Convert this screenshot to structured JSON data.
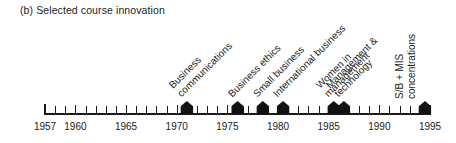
{
  "figure": {
    "panel_label": "(b)",
    "title": "(b) Selected course innovation"
  },
  "chart_data": {
    "type": "timeline",
    "title": "(b) Selected course innovation",
    "xlabel": "",
    "ylabel": "",
    "xlim": [
      1956,
      1996
    ],
    "axis_start": 1956,
    "axis_end": 1996,
    "grid": false,
    "legend": false,
    "tick_interval": 1,
    "tick_labels": [
      "1957",
      "1960",
      "1965",
      "1970",
      "1975",
      "1980",
      "1985",
      "1990",
      "1995"
    ],
    "tick_label_values": [
      1957,
      1960,
      1965,
      1970,
      1975,
      1980,
      1985,
      1990,
      1995
    ],
    "marker_shape": "pentagon",
    "marker_color": "#121212",
    "events": [
      {
        "year": 1971,
        "label": "Business communications",
        "label_lines": [
          "Business",
          "communications"
        ],
        "rotation": 45
      },
      {
        "year": 1976,
        "label": "Business ethics",
        "label_lines": [
          "Business ethics"
        ],
        "rotation": 45
      },
      {
        "year": 1978.5,
        "label": "Small business",
        "label_lines": [
          "Small business"
        ],
        "rotation": 45
      },
      {
        "year": 1980.5,
        "label": "International business",
        "label_lines": [
          "International business"
        ],
        "rotation": 45
      },
      {
        "year": 1985.5,
        "label": "Women in management",
        "label_lines": [
          "Women in",
          "management"
        ],
        "rotation": 45
      },
      {
        "year": 1986.5,
        "label": "Management & technology",
        "label_lines": [
          "Management &",
          "technology"
        ],
        "rotation": 45
      },
      {
        "year": 1994.5,
        "label": "S/B + MIS concentrations",
        "label_lines": [
          "S/B + MIS",
          "concentrations"
        ],
        "rotation": 90
      }
    ]
  },
  "axis": {
    "ticks": [
      {
        "value": 1957,
        "major": true,
        "label": "1957"
      },
      {
        "value": 1958,
        "major": false,
        "label": ""
      },
      {
        "value": 1959,
        "major": false,
        "label": ""
      },
      {
        "value": 1960,
        "major": true,
        "label": "1960"
      },
      {
        "value": 1961,
        "major": false,
        "label": ""
      },
      {
        "value": 1962,
        "major": false,
        "label": ""
      },
      {
        "value": 1963,
        "major": false,
        "label": ""
      },
      {
        "value": 1964,
        "major": false,
        "label": ""
      },
      {
        "value": 1965,
        "major": true,
        "label": "1965"
      },
      {
        "value": 1966,
        "major": false,
        "label": ""
      },
      {
        "value": 1967,
        "major": false,
        "label": ""
      },
      {
        "value": 1968,
        "major": false,
        "label": ""
      },
      {
        "value": 1969,
        "major": false,
        "label": ""
      },
      {
        "value": 1970,
        "major": true,
        "label": "1970"
      },
      {
        "value": 1971,
        "major": false,
        "label": ""
      },
      {
        "value": 1972,
        "major": false,
        "label": ""
      },
      {
        "value": 1973,
        "major": false,
        "label": ""
      },
      {
        "value": 1974,
        "major": false,
        "label": ""
      },
      {
        "value": 1975,
        "major": true,
        "label": "1975"
      },
      {
        "value": 1976,
        "major": false,
        "label": ""
      },
      {
        "value": 1977,
        "major": false,
        "label": ""
      },
      {
        "value": 1978,
        "major": false,
        "label": ""
      },
      {
        "value": 1979,
        "major": false,
        "label": ""
      },
      {
        "value": 1980,
        "major": true,
        "label": "1980"
      },
      {
        "value": 1981,
        "major": false,
        "label": ""
      },
      {
        "value": 1982,
        "major": false,
        "label": ""
      },
      {
        "value": 1983,
        "major": false,
        "label": ""
      },
      {
        "value": 1984,
        "major": false,
        "label": ""
      },
      {
        "value": 1985,
        "major": true,
        "label": "1985"
      },
      {
        "value": 1986,
        "major": false,
        "label": ""
      },
      {
        "value": 1987,
        "major": false,
        "label": ""
      },
      {
        "value": 1988,
        "major": false,
        "label": ""
      },
      {
        "value": 1989,
        "major": false,
        "label": ""
      },
      {
        "value": 1990,
        "major": true,
        "label": "1990"
      },
      {
        "value": 1991,
        "major": false,
        "label": ""
      },
      {
        "value": 1992,
        "major": false,
        "label": ""
      },
      {
        "value": 1993,
        "major": false,
        "label": ""
      },
      {
        "value": 1994,
        "major": false,
        "label": ""
      },
      {
        "value": 1995,
        "major": true,
        "label": "1995"
      }
    ]
  },
  "colors": {
    "background": "#ffffff",
    "ink": "#1a1a1a",
    "marker": "#121212"
  }
}
